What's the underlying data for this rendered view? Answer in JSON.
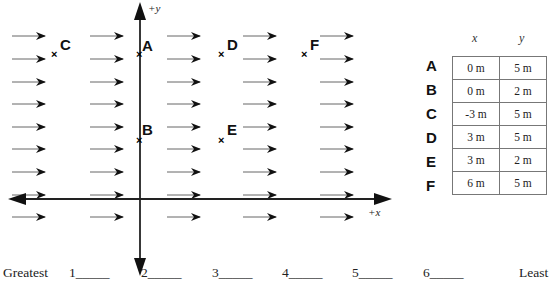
{
  "diagram": {
    "axes": {
      "x_label": "+x",
      "y_label": "+y"
    },
    "field_arrows": {
      "direction": "+x",
      "columns_x": [
        12,
        90,
        167,
        243,
        320
      ],
      "rows_y": [
        36,
        59,
        82,
        104,
        127,
        149,
        172,
        195,
        217
      ],
      "length": 33
    },
    "points": [
      {
        "name": "A",
        "x_m": 0,
        "y_m": 5
      },
      {
        "name": "B",
        "x_m": 0,
        "y_m": 2
      },
      {
        "name": "C",
        "x_m": -3,
        "y_m": 5
      },
      {
        "name": "D",
        "x_m": 3,
        "y_m": 5
      },
      {
        "name": "E",
        "x_m": 3,
        "y_m": 2
      },
      {
        "name": "F",
        "x_m": 6,
        "y_m": 5
      }
    ]
  },
  "table": {
    "headers": [
      "x",
      "y"
    ],
    "rows": [
      {
        "label": "A",
        "x": "0 m",
        "y": "5 m"
      },
      {
        "label": "B",
        "x": "0 m",
        "y": "2 m"
      },
      {
        "label": "C",
        "x": "-3 m",
        "y": "5 m"
      },
      {
        "label": "D",
        "x": "3 m",
        "y": "5 m"
      },
      {
        "label": "E",
        "x": "3 m",
        "y": "2 m"
      },
      {
        "label": "F",
        "x": "6 m",
        "y": "5 m"
      }
    ]
  },
  "ranking": {
    "start_label": "Greatest",
    "end_label": "Least",
    "slots": [
      "1_____",
      "2_____",
      "3_____",
      "4_____",
      "5_____",
      "6_____"
    ]
  }
}
